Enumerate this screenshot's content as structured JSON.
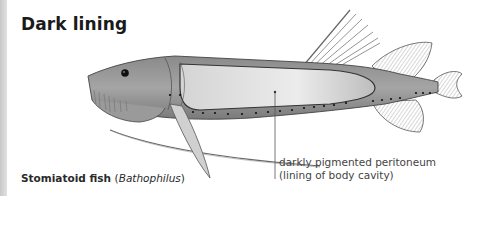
{
  "figure": {
    "title": "Dark lining",
    "caption": {
      "common_name": "Stomiatoid fish",
      "open_paren": "(",
      "scientific_name": "Bathophilus",
      "close_paren": ")"
    },
    "annotation": {
      "line1": "darkly pigmented peritoneum",
      "line2": "(lining of body cavity)"
    }
  }
}
